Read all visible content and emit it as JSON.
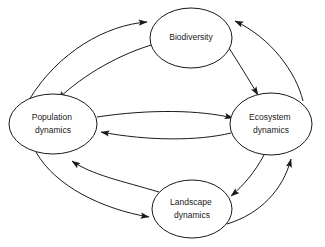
{
  "diagram": {
    "background_color": "#ffffff",
    "stroke_color": "#1a1a1a",
    "nodes": [
      {
        "id": "biodiversity",
        "label": "Biodiversity",
        "lines": [
          "Biodiversity"
        ],
        "cx": 191,
        "cy": 38,
        "rx": 41,
        "ry": 30
      },
      {
        "id": "population-dynamics",
        "label": "Population dynamics",
        "lines": [
          "Population",
          "dynamics"
        ],
        "cx": 53,
        "cy": 124,
        "rx": 44,
        "ry": 30
      },
      {
        "id": "ecosystem-dynamics",
        "label": "Ecosystem dynamics",
        "lines": [
          "Ecosystem",
          "dynamics"
        ],
        "cx": 271,
        "cy": 124,
        "rx": 41,
        "ry": 31
      },
      {
        "id": "landscape-dynamics",
        "label": "Landscape dynamics",
        "lines": [
          "Landscape",
          "dynamics"
        ],
        "cx": 192,
        "cy": 209,
        "rx": 40,
        "ry": 29
      }
    ],
    "edges": [
      {
        "id": "population-to-biodiversity",
        "from": "population-dynamics",
        "to": "biodiversity",
        "direction": "forward",
        "arrowhead": "filled-triangle"
      },
      {
        "id": "biodiversity-to-population",
        "from": "biodiversity",
        "to": "population-dynamics",
        "direction": "forward",
        "arrowhead": "filled-triangle"
      },
      {
        "id": "biodiversity-to-ecosystem",
        "from": "biodiversity",
        "to": "ecosystem-dynamics",
        "direction": "forward",
        "arrowhead": "filled-triangle"
      },
      {
        "id": "ecosystem-to-biodiversity",
        "from": "ecosystem-dynamics",
        "to": "biodiversity",
        "direction": "forward",
        "arrowhead": "filled-triangle"
      },
      {
        "id": "population-to-ecosystem",
        "from": "population-dynamics",
        "to": "ecosystem-dynamics",
        "direction": "forward",
        "arrowhead": "filled-triangle"
      },
      {
        "id": "ecosystem-to-population",
        "from": "ecosystem-dynamics",
        "to": "population-dynamics",
        "direction": "forward",
        "arrowhead": "filled-triangle"
      },
      {
        "id": "population-to-landscape",
        "from": "population-dynamics",
        "to": "landscape-dynamics",
        "direction": "forward",
        "arrowhead": "filled-triangle"
      },
      {
        "id": "landscape-to-population",
        "from": "landscape-dynamics",
        "to": "population-dynamics",
        "direction": "forward",
        "arrowhead": "filled-triangle"
      },
      {
        "id": "landscape-to-ecosystem",
        "from": "landscape-dynamics",
        "to": "ecosystem-dynamics",
        "direction": "forward",
        "arrowhead": "filled-triangle"
      },
      {
        "id": "ecosystem-to-landscape",
        "from": "ecosystem-dynamics",
        "to": "landscape-dynamics",
        "direction": "forward",
        "arrowhead": "filled-triangle"
      }
    ]
  }
}
